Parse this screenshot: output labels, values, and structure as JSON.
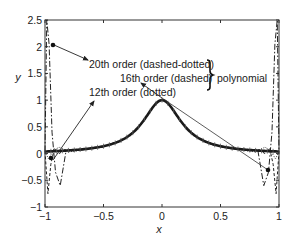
{
  "chart_data": {
    "type": "line",
    "title": "",
    "xlabel": "x",
    "ylabel": "y",
    "xlim": [
      -1,
      1
    ],
    "ylim": [
      -1,
      2.5
    ],
    "grid": false,
    "xticks": [
      -1,
      -0.5,
      0,
      0.5,
      1
    ],
    "xtick_labels": [
      "−1",
      "−0.5",
      "0",
      "0.5",
      "1"
    ],
    "yticks": [
      -1,
      -0.5,
      0,
      0.5,
      1,
      1.5,
      2,
      2.5
    ],
    "ytick_labels": [
      "−1",
      "−0.5",
      "0",
      "0.5",
      "1",
      "1.5",
      "2",
      "2.5"
    ],
    "function": "1/(1+25x^2)",
    "series": [
      {
        "name": "Runge function (solid, thick)",
        "style": "solid",
        "x": [
          -1,
          -0.8,
          -0.6,
          -0.4,
          -0.3,
          -0.2,
          -0.1,
          0,
          0.1,
          0.2,
          0.3,
          0.4,
          0.6,
          0.8,
          1
        ],
        "values": [
          0.038,
          0.059,
          0.1,
          0.2,
          0.31,
          0.5,
          0.8,
          1.0,
          0.8,
          0.5,
          0.31,
          0.2,
          0.1,
          0.059,
          0.038
        ]
      },
      {
        "name": "12th order (dotted)",
        "style": "dotted",
        "x": [
          -1,
          -0.97,
          -0.93,
          -0.88,
          -0.8,
          -0.7,
          0,
          0.7,
          0.8,
          0.88,
          0.93,
          0.97,
          1
        ],
        "values": [
          0.04,
          -0.1,
          0.05,
          0.12,
          0.03,
          0.06,
          1.0,
          0.06,
          0.03,
          0.12,
          0.05,
          -0.1,
          0.04
        ]
      },
      {
        "name": "16th order (dashed)",
        "style": "dashed",
        "x": [
          -1,
          -0.975,
          -0.95,
          -0.92,
          -0.88,
          -0.82,
          0,
          0.82,
          0.88,
          0.92,
          0.95,
          0.975,
          1
        ],
        "values": [
          0.04,
          -0.75,
          -0.2,
          0.1,
          0.0,
          0.08,
          1.0,
          0.08,
          0.0,
          0.1,
          -0.2,
          -0.75,
          0.04
        ]
      },
      {
        "name": "20th order (dashed-dotted)",
        "style": "dashdot",
        "x": [
          -1,
          -0.985,
          -0.965,
          -0.94,
          -0.91,
          -0.87,
          -0.82,
          0,
          0.82,
          0.87,
          0.91,
          0.94,
          0.965,
          0.985,
          1
        ],
        "values": [
          0.04,
          2.5,
          2.05,
          0.4,
          -0.35,
          -0.6,
          0.05,
          1.0,
          0.05,
          -0.6,
          -0.35,
          0.4,
          2.05,
          2.5,
          0.04
        ]
      }
    ],
    "markers": [
      {
        "name": "20th-order-marker",
        "x": -0.952,
        "y": 2.05
      },
      {
        "name": "left-marker",
        "x": -0.955,
        "y": -0.08
      },
      {
        "name": "right-marker",
        "x": 0.94,
        "y": -0.3
      }
    ],
    "annotations": [
      {
        "text": "20th order (dashed-dotted)",
        "x_px": 90,
        "y_px": 64
      },
      {
        "text": "16th order (dashed)",
        "x_px": 120,
        "y_px": 79
      },
      {
        "text": "12th order (dotted)",
        "x_px": 88,
        "y_px": 95
      },
      {
        "text": "polynomial",
        "x_px": 219,
        "y_px": 79
      }
    ],
    "legend_position": "inline annotations with brace"
  },
  "labels": {
    "ann_20": "20th order (dashed-dotted)",
    "ann_16": "16th order (dashed)",
    "ann_12": "12th order (dotted)",
    "polynomial": "polynomial",
    "xlabel": "x",
    "ylabel": "y"
  }
}
